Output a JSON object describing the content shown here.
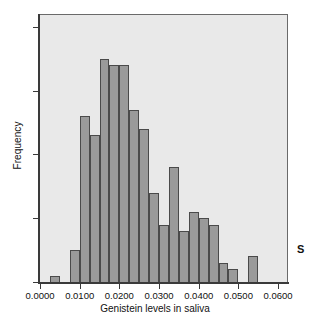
{
  "chart_data": {
    "type": "bar",
    "title": "",
    "subtitle": "",
    "xlabel": "Genistein levels in saliva",
    "ylabel": "Frequency",
    "grid": false,
    "legend": null,
    "xlim": [
      0.0,
      0.0625
    ],
    "ylim": [
      0,
      42
    ],
    "bin_width": 0.0025,
    "xticks": [
      0.0,
      0.01,
      0.02,
      0.03,
      0.04,
      0.05,
      0.06
    ],
    "xtick_labels": [
      "0.0000",
      "0.0100",
      "0.0200",
      "0.0300",
      "0.0400",
      "0.0500",
      "0.0600"
    ],
    "yticks": [
      0,
      10,
      20,
      30,
      40
    ],
    "ytick_labels": [
      "0",
      "10",
      "20",
      "30",
      "40"
    ],
    "bin_starts": [
      0.0,
      0.0025,
      0.005,
      0.0075,
      0.01,
      0.0125,
      0.015,
      0.0175,
      0.02,
      0.0225,
      0.025,
      0.0275,
      0.03,
      0.0325,
      0.035,
      0.0375,
      0.04,
      0.0425,
      0.045,
      0.0475,
      0.05,
      0.0525,
      0.055,
      0.0575,
      0.06
    ],
    "categories": [
      "0.0000",
      "0.0025",
      "0.0050",
      "0.0075",
      "0.0100",
      "0.0125",
      "0.0150",
      "0.0175",
      "0.0200",
      "0.0225",
      "0.0250",
      "0.0275",
      "0.0300",
      "0.0325",
      "0.0350",
      "0.0375",
      "0.0400",
      "0.0425",
      "0.0450",
      "0.0475",
      "0.0500",
      "0.0525",
      "0.0550",
      "0.0575",
      "0.0600"
    ],
    "values": [
      0,
      1,
      0,
      5,
      26,
      23,
      35,
      34,
      34,
      27,
      24,
      14,
      9,
      18,
      8,
      11,
      10,
      9,
      3,
      2,
      0,
      4,
      0,
      0,
      0
    ],
    "bar_fill": "#9a9a9a",
    "bar_edge": "#4a4a4a",
    "plot_background": "#e9e9e9",
    "figure_background": "#ffffff",
    "axis_color": "#3a3a3a"
  },
  "annotations": {
    "right_margin_glyph": "S"
  }
}
